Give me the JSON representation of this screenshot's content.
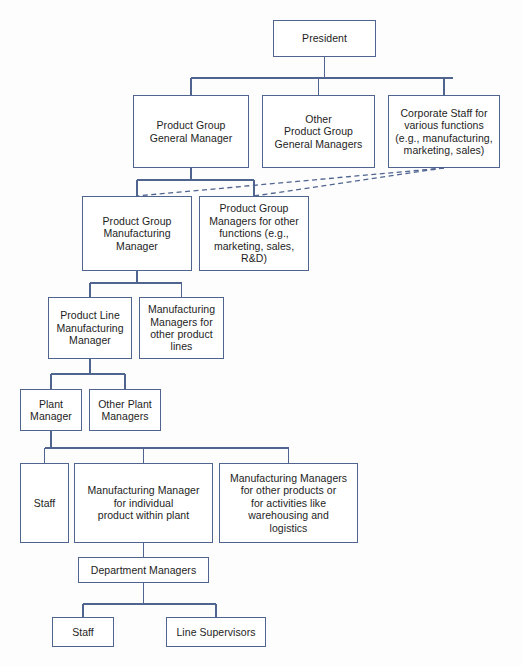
{
  "chart": {
    "type": "org-chart",
    "canvas": {
      "width": 522,
      "height": 666
    },
    "style": {
      "box_border_color": "#4f648f",
      "box_fill_color": "#ffffff",
      "connector_color": "#4f648f",
      "dashed_connector_color": "#4f648f",
      "background_color": "#fdfdfd",
      "text_color": "#1d1d1d"
    },
    "nodes": [
      {
        "id": "president",
        "label": "President",
        "level": 1,
        "x": 273,
        "y": 20,
        "w": 103,
        "h": 37
      },
      {
        "id": "product-group-general-manager",
        "label": "Product Group\nGeneral Manager",
        "level": 2,
        "x": 133,
        "y": 95,
        "w": 116,
        "h": 73
      },
      {
        "id": "other-product-group-general-managers",
        "label": "Other\nProduct Group\nGeneral Managers",
        "level": 2,
        "x": 262,
        "y": 95,
        "w": 113,
        "h": 73
      },
      {
        "id": "corporate-staff",
        "label": "Corporate Staff for\nvarious functions\n(e.g., manufacturing,\nmarketing, sales)",
        "level": 2,
        "x": 388,
        "y": 95,
        "w": 112,
        "h": 73
      },
      {
        "id": "product-group-manufacturing-manager",
        "label": "Product Group\nManufacturing\nManager",
        "level": 3,
        "x": 82,
        "y": 196,
        "w": 110,
        "h": 75
      },
      {
        "id": "product-group-managers-other-functions",
        "label": "Product Group\nManagers for other\nfunctions (e.g.,\nmarketing, sales,\nR&D)",
        "level": 3,
        "x": 199,
        "y": 196,
        "w": 110,
        "h": 75
      },
      {
        "id": "product-line-manufacturing-manager",
        "label": "Product Line\nManufacturing\nManager",
        "level": 4,
        "x": 48,
        "y": 297,
        "w": 84,
        "h": 62
      },
      {
        "id": "manufacturing-managers-other-product-lines",
        "label": "Manufacturing\nManagers for\nother product\nlines",
        "level": 4,
        "x": 139,
        "y": 297,
        "w": 85,
        "h": 62
      },
      {
        "id": "plant-manager",
        "label": "Plant\nManager",
        "level": 5,
        "x": 20,
        "y": 389,
        "w": 62,
        "h": 42
      },
      {
        "id": "other-plant-managers",
        "label": "Other Plant\nManagers",
        "level": 5,
        "x": 89,
        "y": 389,
        "w": 72,
        "h": 42
      },
      {
        "id": "staff-plant",
        "label": "Staff",
        "level": 6,
        "x": 20,
        "y": 463,
        "w": 49,
        "h": 80
      },
      {
        "id": "manufacturing-manager-individual-product",
        "label": "Manufacturing Manager\nfor individual\nproduct within plant",
        "level": 6,
        "x": 74,
        "y": 463,
        "w": 139,
        "h": 80
      },
      {
        "id": "manufacturing-managers-other-products",
        "label": "Manufacturing Managers\nfor other products or\nfor activities like\nwarehousing and\nlogistics",
        "level": 6,
        "x": 219,
        "y": 463,
        "w": 139,
        "h": 80
      },
      {
        "id": "department-managers",
        "label": "Department Managers",
        "level": 7,
        "x": 78,
        "y": 557,
        "w": 131,
        "h": 26
      },
      {
        "id": "staff-department",
        "label": "Staff",
        "level": 8,
        "x": 52,
        "y": 617,
        "w": 62,
        "h": 30
      },
      {
        "id": "line-supervisors",
        "label": "Line Supervisors",
        "level": 8,
        "x": 166,
        "y": 617,
        "w": 100,
        "h": 30
      }
    ],
    "connectors": {
      "solid": [
        {
          "name": "president-to-bus",
          "points": "324.5,57 324.5,78"
        },
        {
          "name": "level2-bus",
          "points": "191,78 453,78"
        },
        {
          "name": "bus-to-product-group-gm",
          "points": "191,78 191,95"
        },
        {
          "name": "bus-to-other-pg-gms",
          "points": "318.5,78 318.5,95"
        },
        {
          "name": "bus-to-corporate-staff",
          "points": "444,78 444,95"
        },
        {
          "name": "pg-gm-to-bus",
          "points": "191,168 191,180"
        },
        {
          "name": "level3-bus",
          "points": "137,180 254,180"
        },
        {
          "name": "bus-to-pg-mfg-mgr",
          "points": "137,180 137,196"
        },
        {
          "name": "bus-to-pg-other-functions",
          "points": "254,180 254,196"
        },
        {
          "name": "pg-mfg-mgr-to-bus",
          "points": "137,271 137,283"
        },
        {
          "name": "level4-bus",
          "points": "90,283 181.5,283"
        },
        {
          "name": "bus-to-product-line-mfg-mgr",
          "points": "90,283 90,297"
        },
        {
          "name": "bus-to-mfg-mgrs-other-lines",
          "points": "181.5,283 181.5,297"
        },
        {
          "name": "product-line-mgr-to-bus",
          "points": "90,359 90,374"
        },
        {
          "name": "level5-bus",
          "points": "51,374 125,374"
        },
        {
          "name": "bus-to-plant-manager",
          "points": "51,374 51,389"
        },
        {
          "name": "bus-to-other-plant-managers",
          "points": "125,374 125,389"
        },
        {
          "name": "plant-manager-to-bus",
          "points": "51,431 51,448"
        },
        {
          "name": "level6-bus",
          "points": "44.5,448 288.5,448"
        },
        {
          "name": "bus-to-staff-plant",
          "points": "44.5,448 44.5,463"
        },
        {
          "name": "bus-to-mfg-mgr-individual",
          "points": "143.5,448 143.5,463"
        },
        {
          "name": "bus-to-mfg-mgrs-other-products",
          "points": "288.5,448 288.5,463"
        },
        {
          "name": "mfg-mgr-to-dept-managers",
          "points": "143.5,543 143.5,557"
        },
        {
          "name": "dept-managers-to-bus",
          "points": "143.5,583 143.5,604"
        },
        {
          "name": "level8-bus",
          "points": "83,604 216,604"
        },
        {
          "name": "bus-to-staff-department",
          "points": "83,604 83,617"
        },
        {
          "name": "bus-to-line-supervisors",
          "points": "216,604 216,617"
        }
      ],
      "dashed": [
        {
          "name": "corporate-staff-to-pg-mfg-mgr",
          "points": "444,168 137,196"
        },
        {
          "name": "corporate-staff-to-pg-other-functions",
          "points": "444,168 254,196"
        }
      ]
    }
  }
}
